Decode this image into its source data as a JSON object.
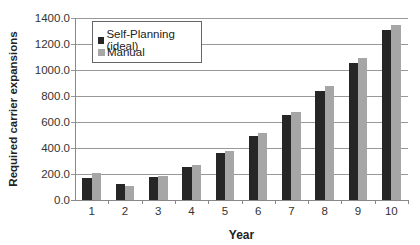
{
  "chart_data": {
    "type": "bar",
    "title": "",
    "xlabel": "Year",
    "ylabel": "Required carrier expansions",
    "ylim": [
      0,
      1400
    ],
    "yticks": [
      "0.0",
      "200.0",
      "400.0",
      "600.0",
      "800.0",
      "1000.0",
      "1200.0",
      "1400.0"
    ],
    "grid": true,
    "legend_position": "upper-left inside",
    "categories": [
      "1",
      "2",
      "3",
      "4",
      "5",
      "6",
      "7",
      "8",
      "9",
      "10"
    ],
    "series": [
      {
        "name": "Self-Planning (ideal)",
        "color": "#262626",
        "values": [
          167,
          121,
          179,
          256,
          364,
          492,
          652,
          841,
          1056,
          1305
        ]
      },
      {
        "name": "Manual",
        "color": "#a6a6a6",
        "values": [
          205,
          110,
          187,
          271,
          379,
          518,
          679,
          877,
          1095,
          1346
        ]
      }
    ]
  }
}
